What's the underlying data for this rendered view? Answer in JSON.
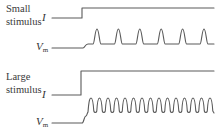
{
  "panels": [
    {
      "title_line1": "Small",
      "title_line2": "stimulus",
      "current_label": "I",
      "voltage_label_main": "V",
      "voltage_label_sub": "m",
      "description": "Small current step produces low-frequency repetitive firing",
      "spike_count": 6
    },
    {
      "title_line1": "Large",
      "title_line2": "stimulus",
      "current_label": "I",
      "voltage_label_main": "V",
      "voltage_label_sub": "m",
      "description": "Large current step produces high-frequency repetitive firing",
      "spike_count": 15
    }
  ],
  "colors": {
    "trace": "#5a5a5a",
    "text": "#3a3a3a",
    "background": "#ffffff"
  }
}
